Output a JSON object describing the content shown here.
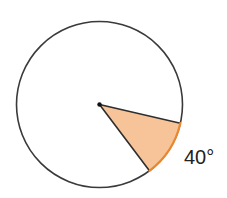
{
  "diagram": {
    "type": "circle-sector",
    "circle": {
      "cx": 99.5,
      "cy": 104.5,
      "r": 83,
      "stroke": "#3a3a3a",
      "stroke_width": 1.6,
      "fill": "#ffffff"
    },
    "sector": {
      "start_angle_deg": 13,
      "sweep_deg": 40,
      "fill": "#F7C49A",
      "edge_stroke": "#2e2e2e",
      "arc_stroke": "#E8872E"
    },
    "center_point": {
      "r": 2.2,
      "fill": "#111111"
    },
    "label": {
      "text": "40°",
      "color": "#222222"
    }
  }
}
